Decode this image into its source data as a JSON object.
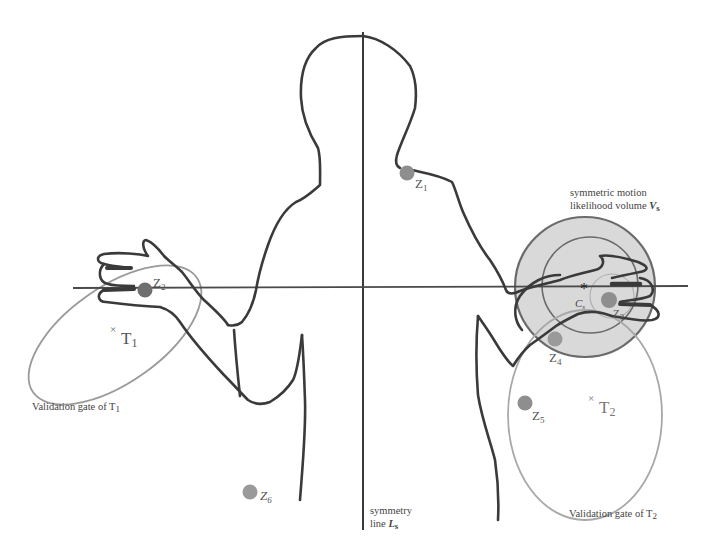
{
  "diagram": {
    "type": "body-tracking-symmetry-illustration",
    "colors": {
      "outline": "#3a3a3a",
      "axis": "#4a4a4a",
      "measurement_dot": "#8e8e8e",
      "gate_ellipse": "#9a9a9a",
      "likelihood_fill": "#d9d9d9",
      "likelihood_stroke": "#6a6a6a"
    },
    "measurements": [
      {
        "id": "z1",
        "label": "Z",
        "sub": "1",
        "x": 407,
        "y": 173
      },
      {
        "id": "z2",
        "label": "Z",
        "sub": "2",
        "x": 145,
        "y": 290
      },
      {
        "id": "z3",
        "label": "Z",
        "sub": "3",
        "x": 609,
        "y": 300
      },
      {
        "id": "z4",
        "label": "Z",
        "sub": "4",
        "x": 555,
        "y": 339
      },
      {
        "id": "z5",
        "label": "Z",
        "sub": "5",
        "x": 525,
        "y": 403
      },
      {
        "id": "z6",
        "label": "Z",
        "sub": "6",
        "x": 250,
        "y": 492
      }
    ],
    "tracks": [
      {
        "id": "T1",
        "label": "T",
        "sub": "1",
        "x": 117,
        "y": 327
      },
      {
        "id": "T2",
        "label": "T",
        "sub": "2",
        "x": 593,
        "y": 408
      }
    ],
    "gates": [
      {
        "id": "gate1",
        "text": "Validation gate of T",
        "sub": "1"
      },
      {
        "id": "gate2",
        "text": "Validation gate of T",
        "sub": "2"
      }
    ],
    "symmetry_line": {
      "line1": "symmetry",
      "line2": "line ",
      "symbol": "L",
      "sub": "s"
    },
    "likelihood_volume": {
      "line1": "symmetric motion",
      "line2": "likelihood volume ",
      "symbol": "V",
      "sub": "s"
    },
    "center": {
      "symbol": "C",
      "sub": "s",
      "marker": "*"
    }
  }
}
